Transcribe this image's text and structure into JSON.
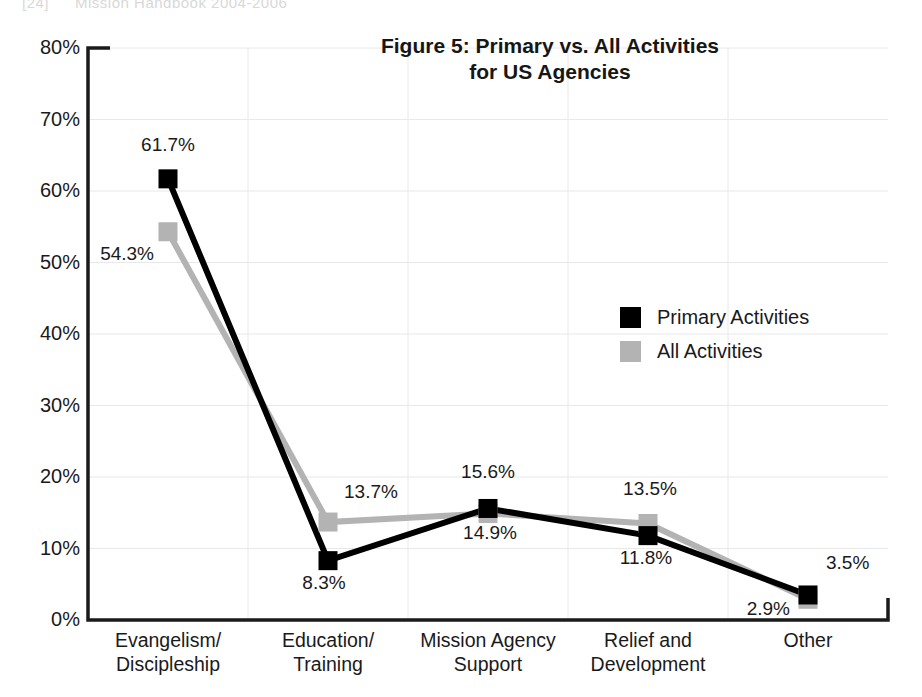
{
  "page_header": {
    "folio": "[24]",
    "running_head": "Mission Handbook 2004-2006"
  },
  "colors": {
    "primary_series": "#000000",
    "all_series": "#b3b3b3",
    "axis": "#1a1a1a",
    "gridline": "#e8e8e8",
    "text": "#1a1a1a"
  },
  "legend": {
    "items": [
      {
        "label": "Primary Activities",
        "color": "#000000"
      },
      {
        "label": "All Activities",
        "color": "#b3b3b3"
      }
    ]
  },
  "chart_data": {
    "type": "line",
    "title": "Figure 5: Primary vs. All Activities for US Agencies",
    "title_line1": "Figure 5: Primary vs. All Activities",
    "title_line2": "for US Agencies",
    "xlabel": "",
    "ylabel": "",
    "ylim": [
      0,
      80
    ],
    "yticks": [
      0,
      10,
      20,
      30,
      40,
      50,
      60,
      70,
      80
    ],
    "ytick_labels": [
      "0%",
      "10%",
      "20%",
      "30%",
      "40%",
      "50%",
      "60%",
      "70%",
      "80%"
    ],
    "grid": true,
    "legend_position": "center-right",
    "categories": [
      "Evangelism/\nDiscipleship",
      "Education/\nTraining",
      "Mission Agency\nSupport",
      "Relief and\nDevelopment",
      "Other"
    ],
    "category_labels": [
      {
        "line1": "Evangelism/",
        "line2": "Discipleship"
      },
      {
        "line1": "Education/",
        "line2": "Training"
      },
      {
        "line1": "Mission Agency",
        "line2": "Support"
      },
      {
        "line1": "Relief and",
        "line2": "Development"
      },
      {
        "line1": "Other",
        "line2": ""
      }
    ],
    "series": [
      {
        "name": "Primary Activities",
        "color": "#000000",
        "values": [
          61.7,
          8.3,
          15.6,
          11.8,
          3.5
        ],
        "labels": [
          "61.7%",
          "8.3%",
          "15.6%",
          "11.8%",
          "3.5%"
        ]
      },
      {
        "name": "All Activities",
        "color": "#b3b3b3",
        "values": [
          54.3,
          13.7,
          14.9,
          13.5,
          2.9
        ],
        "labels": [
          "54.3%",
          "13.7%",
          "14.9%",
          "13.5%",
          "2.9%"
        ]
      }
    ]
  }
}
